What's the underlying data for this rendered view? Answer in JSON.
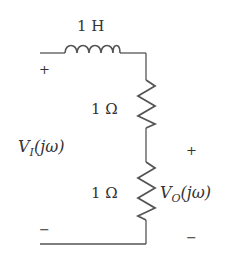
{
  "circuit": {
    "inductor": {
      "label": "1 H"
    },
    "resistor_top": {
      "label": "1 Ω"
    },
    "resistor_bottom": {
      "label": "1 Ω"
    },
    "input": {
      "plus": "+",
      "minus": "−",
      "label_main": "V",
      "label_sub": "I",
      "label_arg": "(jω)"
    },
    "output": {
      "plus": "+",
      "minus": "−",
      "label_main": "V",
      "label_sub": "O",
      "label_arg": "(jω)"
    }
  },
  "colors": {
    "wire": "#555555",
    "text": "#333333",
    "background": "#ffffff"
  }
}
